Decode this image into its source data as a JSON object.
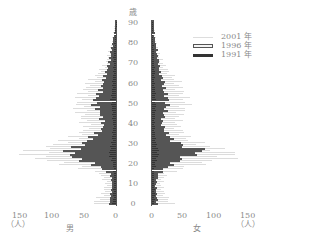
{
  "chart_data": {
    "type": "bar",
    "subtype": "population-pyramid",
    "title": "",
    "age_unit": "歳",
    "count_unit": "（人）",
    "left_label": "男",
    "right_label": "女",
    "age_ticks": [
      0,
      10,
      20,
      30,
      40,
      50,
      60,
      70,
      80,
      90
    ],
    "x_ticks_left": [
      150,
      100,
      50,
      0
    ],
    "x_ticks_right": [
      0,
      50,
      100,
      150
    ],
    "xlim": [
      0,
      150
    ],
    "ylim": [
      0,
      90
    ],
    "legend": [
      "2001 年",
      "1996 年",
      "1991 年"
    ],
    "legend_position": "upper-right",
    "ages": [
      0,
      5,
      10,
      15,
      20,
      22,
      24,
      26,
      28,
      30,
      32,
      34,
      36,
      38,
      40,
      45,
      50,
      55,
      60,
      65,
      70,
      75,
      80,
      85,
      90
    ],
    "series": [
      {
        "name": "2001 年",
        "male": [
          35,
          20,
          15,
          25,
          90,
          120,
          130,
          125,
          105,
          85,
          70,
          60,
          50,
          45,
          50,
          55,
          60,
          50,
          40,
          25,
          15,
          10,
          6,
          3,
          1
        ],
        "female": [
          30,
          18,
          14,
          22,
          85,
          115,
          125,
          110,
          90,
          70,
          55,
          50,
          45,
          40,
          40,
          45,
          55,
          45,
          40,
          25,
          15,
          10,
          6,
          4,
          1
        ]
      },
      {
        "name": "1996 年",
        "male": [
          10,
          8,
          6,
          8,
          40,
          60,
          70,
          72,
          60,
          50,
          40,
          35,
          25,
          20,
          20,
          25,
          35,
          25,
          20,
          15,
          10,
          8,
          5,
          2,
          1
        ],
        "female": [
          8,
          7,
          6,
          10,
          35,
          45,
          60,
          85,
          55,
          40,
          30,
          25,
          20,
          18,
          15,
          20,
          25,
          20,
          18,
          12,
          10,
          8,
          5,
          3,
          1
        ]
      },
      {
        "name": "1991 年",
        "male": [
          5,
          4,
          3,
          3,
          5,
          8,
          10,
          10,
          8,
          6,
          6,
          5,
          5,
          4,
          5,
          6,
          8,
          6,
          5,
          4,
          4,
          3,
          2,
          1,
          0
        ],
        "female": [
          4,
          4,
          3,
          3,
          6,
          8,
          10,
          10,
          8,
          6,
          5,
          5,
          4,
          4,
          4,
          5,
          6,
          5,
          4,
          4,
          3,
          3,
          2,
          1,
          0
        ]
      }
    ]
  },
  "labels": {
    "age_unit": "歳",
    "ticks": [
      "90",
      "80",
      "70",
      "60",
      "50",
      "40",
      "30",
      "20",
      "10",
      "0"
    ],
    "left_x": [
      "150",
      "100",
      "50",
      "0"
    ],
    "right_x": [
      "0",
      "50",
      "100",
      "150"
    ],
    "unit_left": "（人）",
    "unit_right": "（人）",
    "male": "男",
    "female": "女",
    "legend": [
      "2001 年",
      "1996 年",
      "1991 年"
    ]
  }
}
